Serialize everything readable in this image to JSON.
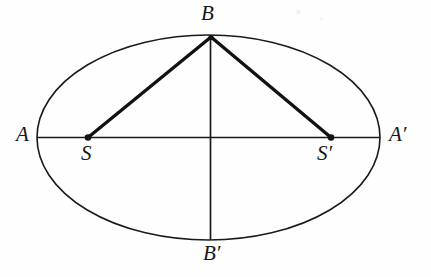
{
  "figure": {
    "background_color": "#fefefe",
    "stroke_color": "#1a1a1a",
    "width": 431,
    "height": 277
  },
  "labels": {
    "a": "A",
    "a_prime": "A′",
    "b": "B",
    "b_prime": "B′",
    "s": "S",
    "s_prime": "S′"
  },
  "geometry": {
    "ellipse": {
      "center_x": 208.5,
      "center_y": 137.5,
      "radius_x": 171.5,
      "radius_y": 102.5,
      "stroke_width": 1.6
    },
    "major_axis": {
      "x1": 37,
      "y1": 137.5,
      "x2": 380,
      "y2": 137.5
    },
    "minor_axis": {
      "x1": 210.5,
      "y1": 36,
      "x2": 210.5,
      "y2": 240
    },
    "focus_left": {
      "x": 88,
      "y": 137.5,
      "radius": 3.3
    },
    "focus_right": {
      "x": 331,
      "y": 137.5,
      "radius": 3.3
    },
    "apex": {
      "x": 211,
      "y": 37
    },
    "focal_radius_left": {
      "x1": 211,
      "y1": 37,
      "x2": 88,
      "y2": 137.5,
      "stroke_width": 3.4
    },
    "focal_radius_right": {
      "x1": 211,
      "y1": 37,
      "x2": 331,
      "y2": 137.5,
      "stroke_width": 3.4
    }
  },
  "label_positions": {
    "a": {
      "left": 16,
      "top": 124
    },
    "a_prime": {
      "left": 389,
      "top": 124
    },
    "b": {
      "left": 201,
      "top": 3
    },
    "b_prime": {
      "left": 203,
      "top": 243
    },
    "s": {
      "left": 81,
      "top": 143
    },
    "s_prime": {
      "left": 317,
      "top": 143
    }
  }
}
